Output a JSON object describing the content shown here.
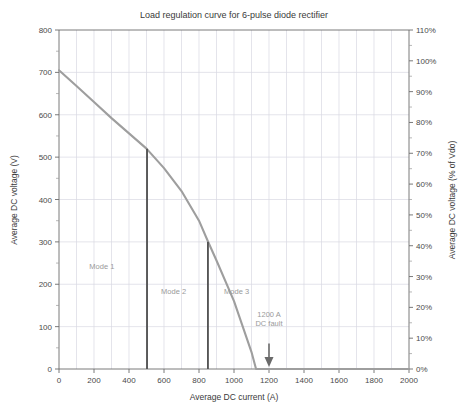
{
  "chart_data": {
    "type": "line",
    "title": "Load regulation curve for 6-pulse diode rectifier",
    "xlabel": "Average DC current (A)",
    "ylabel": "Average DC voltage (V)",
    "ylabel_right": "Average DC voltage (% of Vdo)",
    "xlim": [
      0,
      2000
    ],
    "ylim": [
      0,
      800
    ],
    "ylim_right": [
      0,
      110
    ],
    "xticks": [
      0,
      200,
      400,
      600,
      800,
      1000,
      1200,
      1400,
      1600,
      1800,
      2000
    ],
    "xtick_labels": [
      "0",
      "200",
      "400",
      "600",
      "800",
      "1000",
      "1200",
      "1400",
      "1600",
      "1800",
      "2000"
    ],
    "yticks": [
      0,
      100,
      200,
      300,
      400,
      500,
      600,
      700,
      800
    ],
    "ytick_labels": [
      "0",
      "100",
      "200",
      "300",
      "400",
      "500",
      "600",
      "700",
      "800"
    ],
    "yticks_right": [
      0,
      10,
      20,
      30,
      40,
      50,
      60,
      70,
      80,
      90,
      100,
      110
    ],
    "ytick_labels_right": [
      "0%",
      "10%",
      "20%",
      "30%",
      "40%",
      "50%",
      "60%",
      "70%",
      "80%",
      "90%",
      "100%",
      "110%"
    ],
    "grid": true,
    "legend": "none",
    "series": [
      {
        "name": "Average DC voltage",
        "color": "#9e9e9e",
        "points": [
          [
            0,
            705
          ],
          [
            100,
            668
          ],
          [
            200,
            630
          ],
          [
            300,
            592
          ],
          [
            400,
            556
          ],
          [
            500,
            520
          ],
          [
            600,
            474
          ],
          [
            700,
            420
          ],
          [
            800,
            350
          ],
          [
            850,
            302
          ],
          [
            900,
            256
          ],
          [
            1000,
            160
          ],
          [
            1100,
            40
          ],
          [
            1126,
            0
          ],
          [
            1200,
            0
          ],
          [
            1400,
            0
          ],
          [
            1600,
            0
          ],
          [
            1800,
            0
          ],
          [
            2000,
            0
          ]
        ]
      }
    ],
    "mode_boundaries": [
      {
        "name": "mode-1-2-boundary",
        "current": 503,
        "voltage_top": 520,
        "color": "#555555"
      },
      {
        "name": "mode-2-3-boundary",
        "current": 851,
        "voltage_top": 300,
        "color": "#555555"
      }
    ],
    "annotations": [
      {
        "name": "mode-1-label",
        "text": "Mode 1",
        "current": 245,
        "voltage": 237,
        "color": "#9a9a9a"
      },
      {
        "name": "mode-2-label",
        "text": "Mode 2",
        "current": 655,
        "voltage": 177,
        "color": "#9a9a9a"
      },
      {
        "name": "mode-3-label",
        "text": "Mode 3",
        "current": 1015,
        "voltage": 177,
        "color": "#9a9a9a"
      },
      {
        "name": "dc-fault-label-line1",
        "text": "1200 A",
        "current": 1200,
        "voltage": 122,
        "color": "#9a9a9a"
      },
      {
        "name": "dc-fault-label-line2",
        "text": "DC fault",
        "current": 1200,
        "voltage": 102,
        "color": "#9a9a9a"
      },
      {
        "name": "dc-fault-arrow",
        "text": "",
        "current": 1200,
        "voltage": 60,
        "color": "#6a6a6a"
      }
    ]
  }
}
